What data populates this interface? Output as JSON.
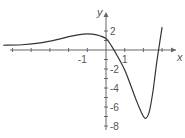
{
  "chart_data": {
    "type": "line",
    "title": "",
    "xlabel": "x",
    "ylabel": "y",
    "xlim": [
      -5.7,
      3.5
    ],
    "ylim": [
      -8.3,
      2.8
    ],
    "grid": false,
    "x_tick_labels": [
      {
        "value": -1,
        "label": "-1"
      },
      {
        "value": 1,
        "label": "1"
      }
    ],
    "y_tick_labels": [
      {
        "value": 2,
        "label": "2"
      },
      {
        "value": -2,
        "label": "-2"
      },
      {
        "value": -4,
        "label": "-4"
      },
      {
        "value": -6,
        "label": "-6"
      },
      {
        "value": -8,
        "label": "-8"
      }
    ],
    "series": [
      {
        "name": "f(x)",
        "x": [
          -5.5,
          -4.5,
          -3.5,
          -2.5,
          -2.0,
          -1.5,
          -1.0,
          -0.5,
          0.0,
          0.3,
          0.6,
          1.0,
          1.3,
          1.6,
          1.9,
          2.1,
          2.3,
          2.5,
          2.7,
          2.85,
          3.0
        ],
        "y": [
          0.5,
          0.55,
          0.75,
          1.15,
          1.4,
          1.6,
          1.7,
          1.6,
          1.2,
          0.4,
          -0.6,
          -2.1,
          -3.6,
          -5.2,
          -6.6,
          -7.2,
          -6.6,
          -4.5,
          -1.5,
          0.5,
          2.4
        ]
      }
    ]
  },
  "axes": {
    "x_label": "x",
    "y_label": "y"
  }
}
